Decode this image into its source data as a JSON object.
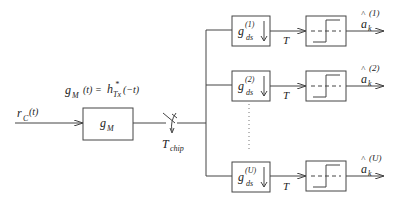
{
  "diagram": {
    "input_signal": {
      "base": "r",
      "sub": "C",
      "arg": "(t)"
    },
    "matched_filter": {
      "label_base": "g",
      "label_sub": "M",
      "equation": {
        "lhs_base": "g",
        "lhs_sub": "M",
        "lhs_arg": "(t) =",
        "rhs_base": "h",
        "rhs_sup": "*",
        "rhs_sub": "Tx",
        "rhs_arg": "(−t)"
      }
    },
    "sampler": {
      "label_base": "T",
      "label_sub": "chip"
    },
    "branches": [
      {
        "filter_base": "g",
        "filter_sup": "(1)",
        "filter_sub": "ds",
        "downsample_label": "T",
        "output_base": "a",
        "output_hat": "^",
        "output_sup": "(1)",
        "output_sub": "k"
      },
      {
        "filter_base": "g",
        "filter_sup": "(2)",
        "filter_sub": "ds",
        "downsample_label": "T",
        "output_base": "a",
        "output_hat": "^",
        "output_sup": "(2)",
        "output_sub": "k"
      },
      {
        "filter_base": "g",
        "filter_sup": "(U)",
        "filter_sub": "ds",
        "downsample_label": "T",
        "output_base": "a",
        "output_hat": "^",
        "output_sup": "(U)",
        "output_sub": "k"
      }
    ]
  }
}
